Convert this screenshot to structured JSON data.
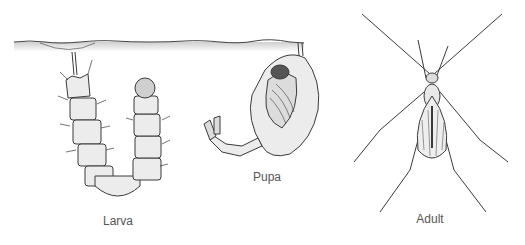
{
  "diagram": {
    "stages": [
      {
        "id": "larva",
        "label": "Larva",
        "x": 118,
        "y": 214
      },
      {
        "id": "pupa",
        "label": "Pupa",
        "x": 267,
        "y": 170
      },
      {
        "id": "adult",
        "label": "Adult",
        "x": 430,
        "y": 212
      }
    ],
    "colors": {
      "line": "#3a3a3a",
      "fill": "#e6e6e6",
      "water": "#d0d0d0",
      "label": "#555555"
    }
  }
}
